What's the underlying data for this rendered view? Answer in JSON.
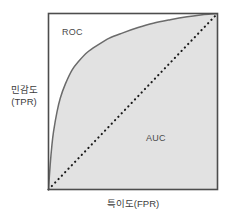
{
  "figure": {
    "name": "roc-auc-diagram",
    "background_color": "#ffffff"
  },
  "axes": {
    "y_label_line1": "민감도",
    "y_label_line2": "(TPR)",
    "x_label": "특이도(FPR)",
    "frame_color": "#4d4d4d",
    "plot_background": "#ffffff"
  },
  "annotations": {
    "roc_label": "ROC",
    "auc_label": "AUC"
  },
  "chart_data": {
    "type": "line",
    "title": "",
    "xlabel": "특이도(FPR)",
    "ylabel": "민감도 (TPR)",
    "xlim": [
      0,
      1
    ],
    "ylim": [
      0,
      1
    ],
    "grid": false,
    "legend": "none",
    "fill_color": "#e2e2e2",
    "curve_color": "#6b6b6b",
    "diagonal_color": "#1a1a1a",
    "diagonal_style": "dotted",
    "series": [
      {
        "name": "ROC",
        "style": "solid",
        "fill": "area-under-curve",
        "x": [
          0.0,
          0.01,
          0.02,
          0.03,
          0.05,
          0.07,
          0.1,
          0.14,
          0.18,
          0.23,
          0.29,
          0.36,
          0.44,
          0.53,
          0.62,
          0.72,
          0.82,
          0.9,
          0.96,
          1.0
        ],
        "y": [
          0.0,
          0.14,
          0.25,
          0.33,
          0.44,
          0.52,
          0.6,
          0.68,
          0.73,
          0.78,
          0.82,
          0.86,
          0.89,
          0.92,
          0.945,
          0.965,
          0.982,
          0.992,
          0.997,
          1.0
        ]
      },
      {
        "name": "Chance (diagonal)",
        "style": "dotted",
        "x": [
          0.0,
          1.0
        ],
        "y": [
          0.0,
          1.0
        ]
      }
    ],
    "annotations": [
      {
        "text": "ROC",
        "x": 0.1,
        "y": 0.88
      },
      {
        "text": "AUC",
        "x": 0.6,
        "y": 0.33
      }
    ]
  }
}
